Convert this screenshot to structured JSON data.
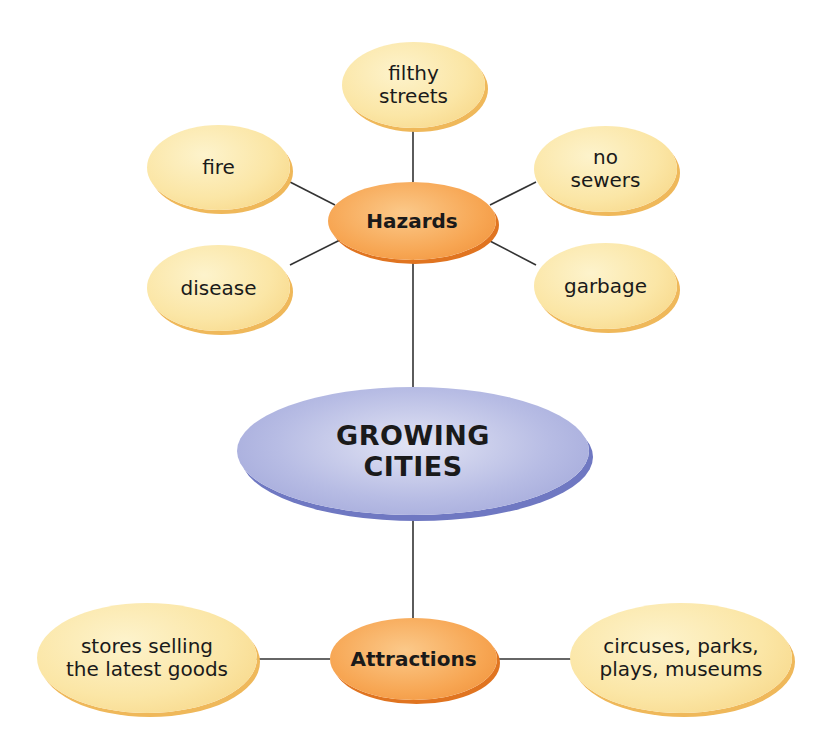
{
  "diagram": {
    "type": "concept-web",
    "center": {
      "label": "GROWING\nCITIES"
    },
    "branches": [
      {
        "label": "Hazards",
        "children": [
          "filthy\nstreets",
          "fire",
          "no\nsewers",
          "disease",
          "garbage"
        ]
      },
      {
        "label": "Attractions",
        "children": [
          "stores selling\nthe latest goods",
          "circuses, parks,\nplays, museums"
        ]
      }
    ],
    "colors": {
      "leaf_fill": "#fbe6a6",
      "hub_fill": "#f7a653",
      "center_fill": "#b7bce4",
      "line": "#333333"
    }
  }
}
